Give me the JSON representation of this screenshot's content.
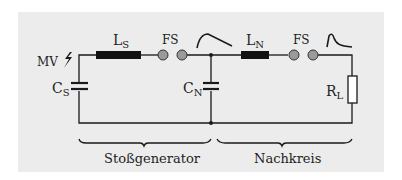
{
  "diagram": {
    "type": "circuit-schematic",
    "colors": {
      "background": "#ececec",
      "wire": "#1a1a1a",
      "inductor_fill": "#111111",
      "spark_gap_fill": "#9a9a9a"
    },
    "components": {
      "mv": {
        "label": "MV",
        "symbol": "lightning-icon"
      },
      "cs": {
        "label_main": "C",
        "label_sub": "S",
        "type": "capacitor"
      },
      "ls": {
        "label_main": "L",
        "label_sub": "S",
        "type": "inductor"
      },
      "fs1": {
        "label": "FS",
        "type": "spark-gap"
      },
      "cn": {
        "label_main": "C",
        "label_sub": "N",
        "type": "capacitor"
      },
      "ln": {
        "label_main": "L",
        "label_sub": "N",
        "type": "inductor"
      },
      "fs2": {
        "label": "FS",
        "type": "spark-gap"
      },
      "rl": {
        "label_main": "R",
        "label_sub": "L",
        "type": "resistor"
      }
    },
    "waveforms": {
      "after_fs1": "slow-rise-decay-waveform",
      "after_fs2": "fast-impulse-waveform"
    },
    "sections": [
      {
        "label": "Stoßgenerator"
      },
      {
        "label": "Nachkreis"
      }
    ]
  }
}
